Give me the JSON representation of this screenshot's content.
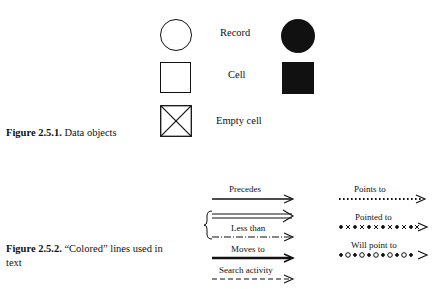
{
  "figure1": {
    "number": "Figure 2.5.1.",
    "title": "Data objects",
    "rows": [
      {
        "label": "Record",
        "outline_shape": "circle",
        "filled_shape": "filled-circle"
      },
      {
        "label": "Cell",
        "outline_shape": "square",
        "filled_shape": "filled-square"
      },
      {
        "label": "Empty cell",
        "outline_shape": "crossed-square",
        "filled_shape": null
      }
    ]
  },
  "figure2": {
    "number": "Figure 2.5.2.",
    "title_line1": "“Colored” lines used in",
    "title_line2": "text",
    "left_lines": [
      {
        "label": "Precedes",
        "style": "solid-thin-arrow"
      },
      {
        "label": "Less than",
        "style": "double-solid-and-dashdot-with-brace"
      },
      {
        "label": "Moves to",
        "style": "solid-thick-arrow"
      },
      {
        "label": "Search activity",
        "style": "dashed-arrow"
      }
    ],
    "right_lines": [
      {
        "label": "Points to",
        "style": "dotted-arrow",
        "pattern": "················"
      },
      {
        "label": "Pointed to",
        "style": "x-dot-arrow",
        "pattern": "•x•x•x•x•x•x"
      },
      {
        "label": "Will point to",
        "style": "o-dot-arrow",
        "pattern": "•o•o•o•o•o•o"
      }
    ]
  }
}
